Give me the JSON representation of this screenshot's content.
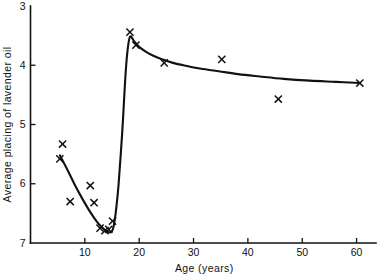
{
  "chart_data": {
    "type": "scatter",
    "title": "",
    "subtitle": "",
    "xlabel": "Age (years)",
    "ylabel": "Average placing of lavender oil",
    "xlim": [
      0,
      61
    ],
    "ylim": [
      3,
      7
    ],
    "y_axis_inverted": true,
    "grid": false,
    "legend": null,
    "xticks": [
      10,
      20,
      30,
      40,
      50,
      60
    ],
    "xtick_labels": [
      "10",
      "20",
      "30",
      "40",
      "50",
      "60"
    ],
    "yticks": [
      3,
      4,
      5,
      6,
      7
    ],
    "ytick_labels": [
      "3",
      "4",
      "5",
      "6",
      "7"
    ],
    "marker_symbol": "x",
    "marker_color": "#111111",
    "curve_color": "#111111",
    "points": [
      {
        "x": 5.4,
        "y": 5.58
      },
      {
        "x": 5.9,
        "y": 5.33
      },
      {
        "x": 7.3,
        "y": 6.3
      },
      {
        "x": 11.0,
        "y": 6.03
      },
      {
        "x": 11.7,
        "y": 6.32
      },
      {
        "x": 12.8,
        "y": 6.75
      },
      {
        "x": 13.7,
        "y": 6.79
      },
      {
        "x": 14.4,
        "y": 6.77
      },
      {
        "x": 15.1,
        "y": 6.63
      },
      {
        "x": 18.3,
        "y": 3.44
      },
      {
        "x": 19.4,
        "y": 3.66
      },
      {
        "x": 24.6,
        "y": 3.96
      },
      {
        "x": 35.2,
        "y": 3.9
      },
      {
        "x": 45.6,
        "y": 4.57
      },
      {
        "x": 60.6,
        "y": 4.3
      }
    ],
    "series": [
      {
        "name": "fitted curve",
        "x": [
          5.4,
          6.6,
          8.0,
          9.4,
          10.8,
          12.2,
          13.2,
          14.0,
          14.6,
          15.0,
          15.3,
          15.7,
          16.2,
          16.9,
          17.4,
          17.8,
          18.3,
          19.1,
          20.0,
          21.2,
          22.6,
          24.2,
          26.2,
          28.6,
          31.4,
          34.6,
          38.2,
          42.2,
          46.6,
          51.4,
          56.2,
          60.6
        ],
        "y": [
          5.52,
          5.73,
          5.99,
          6.23,
          6.45,
          6.64,
          6.74,
          6.8,
          6.82,
          6.8,
          6.72,
          6.48,
          6.02,
          5.1,
          4.28,
          3.8,
          3.52,
          3.6,
          3.69,
          3.77,
          3.84,
          3.9,
          3.96,
          4.01,
          4.06,
          4.1,
          4.15,
          4.19,
          4.23,
          4.26,
          4.28,
          4.3
        ]
      }
    ]
  },
  "axes": {
    "x_title": "Age (years)",
    "y_title": "Average placing of lavender oil"
  }
}
